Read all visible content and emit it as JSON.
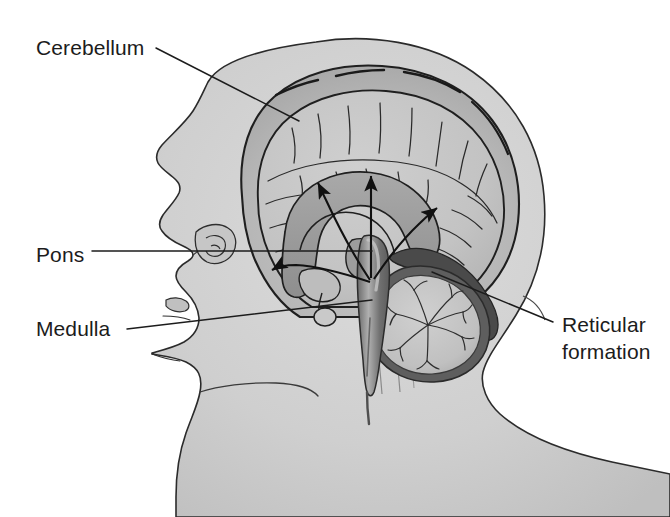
{
  "figure": {
    "background_color": "#ffffff",
    "width": 670,
    "height": 517
  },
  "colors": {
    "page_background": "#ffffff",
    "head_fill": "#cfcfcf",
    "head_outline": "#2b2b2b",
    "skull_vault_fill": "#bdbdbd",
    "brain_cortex_fill": "#c6c6c6",
    "brain_outline": "#1f1f1f",
    "corpus_callosum_fill": "#9a9a9a",
    "brainstem_fill": "#6f6f6f",
    "brainstem_highlight": "#b5b5b5",
    "cerebellum_fill": "#c2c2c2",
    "cerebellum_rim": "#5a5a5a",
    "tentorium_dark": "#4a4a4a",
    "arrow_color": "#111111",
    "leader_line_color": "#1c1c1c",
    "label_text_color": "#1c1c1c"
  },
  "labels": [
    {
      "id": "cerebellum",
      "text": "Cerebellum",
      "text_x": 36,
      "text_y": 55,
      "anchor": "start",
      "leader": {
        "x1": 156,
        "y1": 48,
        "x2": 299,
        "y2": 121
      }
    },
    {
      "id": "pons",
      "text": "Pons",
      "text_x": 36,
      "text_y": 262,
      "anchor": "start",
      "leader": {
        "x1": 92,
        "y1": 251,
        "x2": 372,
        "y2": 251
      }
    },
    {
      "id": "medulla",
      "text": "Medulla",
      "text_x": 36,
      "text_y": 336,
      "anchor": "start",
      "leader": {
        "x1": 127,
        "y1": 329,
        "x2": 372,
        "y2": 300
      }
    },
    {
      "id": "reticular-formation",
      "text_line_1": "Reticular",
      "text_line_2": "formation",
      "text_x": 562,
      "text_y": 332,
      "anchor": "start",
      "leader": {
        "x1": 553,
        "y1": 322,
        "x2": 432,
        "y2": 272
      }
    }
  ],
  "anatomy": {
    "structures": [
      {
        "name": "head-profile",
        "description": "Lateral silhouette of a human head, face pointing left, with neck and shoulders"
      },
      {
        "name": "skull-vault",
        "description": "Cranial bone layer surrounding the brain"
      },
      {
        "name": "cerebral-cortex",
        "description": "Folded cerebral hemisphere with gyri and sulci"
      },
      {
        "name": "corpus-callosum",
        "description": "Arched pale band beneath the cortex"
      },
      {
        "name": "thalamus",
        "description": "Oval mass at center of brain"
      },
      {
        "name": "brainstem",
        "description": "Vertical column containing midbrain, pons and medulla"
      },
      {
        "name": "cerebellum",
        "description": "Posterior-inferior structure showing arbor vitae folia"
      },
      {
        "name": "tentorium",
        "description": "Dark membranous fold above the cerebellum"
      },
      {
        "name": "pituitary",
        "description": "Small rounded gland below the hypothalamus"
      }
    ],
    "projection_arrows": {
      "count": 4,
      "origin_description": "Reticular formation within the brainstem",
      "description": "Arrows fanning upward and outward to the cerebral cortex representing ascending reticular activating system projections",
      "targets": [
        "anterior-cortex-left",
        "mid-frontal-cortex",
        "superior-cortex",
        "posterior-cortex-right"
      ]
    }
  }
}
